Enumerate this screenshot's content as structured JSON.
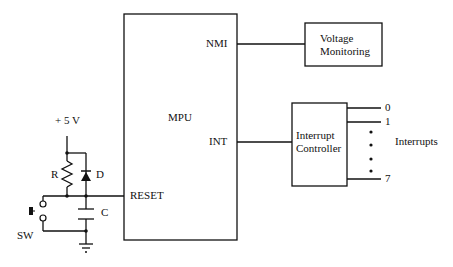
{
  "diagram": {
    "type": "circuit-block-diagram",
    "blocks": {
      "mpu": {
        "label": "MPU",
        "pins": {
          "nmi": "NMI",
          "int": "INT",
          "reset": "RESET"
        }
      },
      "voltage_monitoring": {
        "line1": "Voltage",
        "line2": "Monitoring"
      },
      "interrupt_controller": {
        "line1": "Interrupt",
        "line2": "Controller"
      }
    },
    "reset_circuit": {
      "supply": "+ 5 V",
      "resistor": "R",
      "diode": "D",
      "capacitor": "C",
      "switch": "SW"
    },
    "interrupts": {
      "label": "Interrupts",
      "lines": [
        "0",
        "1",
        "7"
      ]
    },
    "colors": {
      "line": "#111111",
      "background": "#ffffff"
    }
  }
}
